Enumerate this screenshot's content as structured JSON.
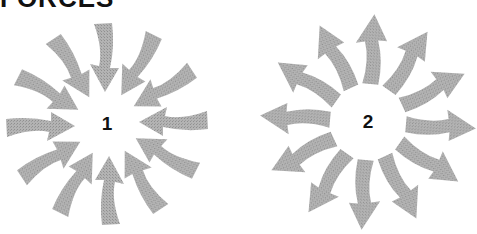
{
  "title": "FORCES",
  "colors": {
    "arrow": "#a9a9a9",
    "text": "#111111",
    "background": "#ffffff"
  },
  "figures": [
    {
      "label": "1",
      "direction": "inward",
      "arrow_count": 12,
      "center": [
        107,
        124
      ]
    },
    {
      "label": "2",
      "direction": "outward",
      "arrow_count": 12,
      "center": [
        368,
        122
      ]
    }
  ]
}
